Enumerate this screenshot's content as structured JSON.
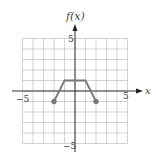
{
  "chart_data": {
    "type": "line",
    "title": "",
    "xlabel": "x",
    "ylabel": "f(x)",
    "xlim": [
      -5,
      5
    ],
    "ylim": [
      -5,
      5
    ],
    "grid": true,
    "x_ticks_labeled": [
      "-5",
      "5"
    ],
    "y_ticks_labeled": [
      "5",
      "-5"
    ],
    "series": [
      {
        "name": "f(x)",
        "x": [
          -2,
          -1,
          1,
          2
        ],
        "y": [
          -1,
          1,
          1,
          -1
        ],
        "endpoints": [
          {
            "x": -2,
            "y": -1,
            "style": "closed"
          },
          {
            "x": 2,
            "y": -1,
            "style": "closed"
          }
        ]
      }
    ],
    "colors": {
      "line": "#777777",
      "grid": "#c8c8c8",
      "axis": "#333333"
    }
  },
  "labels": {
    "y_axis": "f(x)",
    "x_axis": "x",
    "x_min": "−5",
    "x_max": "5",
    "y_max": "5",
    "y_min": "−5"
  }
}
